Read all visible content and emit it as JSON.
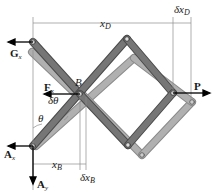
{
  "diagram": {
    "labels": {
      "x_D": "x",
      "x_D_sub": "D",
      "delta_x_D": "δx",
      "delta_x_D_sub": "D",
      "G_x": "G",
      "G_x_sub": "x",
      "F_x": "F",
      "F_x_sub": "x",
      "B": "B",
      "P": "P",
      "delta_theta": "δθ",
      "theta": "θ",
      "A_x": "A",
      "A_x_sub": "x",
      "A_y": "A",
      "A_y_sub": "y",
      "x_B": "x",
      "x_B_sub": "B",
      "delta_x_B": "δx",
      "delta_x_B_sub": "B"
    },
    "colors": {
      "link_dark": "#6e6e6e",
      "link_dark_edge": "#4a4a4a",
      "link_light": "#a9a9a9",
      "link_light_edge": "#8a8a8a",
      "dim_line": "#8c8c8c",
      "arrow": "#000000",
      "text": "#1a1a1a"
    }
  }
}
